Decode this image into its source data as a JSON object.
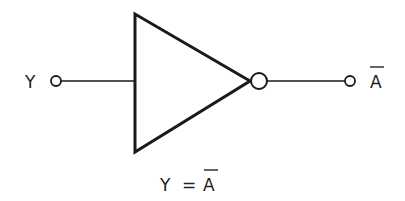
{
  "diagram": {
    "type": "logic-gate",
    "gate": "NOT (inverter)",
    "input_label": "Y",
    "output_label": "A",
    "output_label_overbar": true,
    "caption": {
      "lhs": "Y",
      "equals": "=",
      "rhs": "A",
      "rhs_overbar": true
    },
    "stroke_color": "#1a1a1a",
    "background": "#ffffff"
  }
}
